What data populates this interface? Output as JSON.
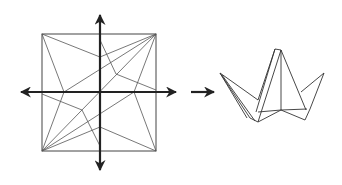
{
  "diagram": {
    "type": "origami-instruction",
    "steps": [
      {
        "name": "crease-pattern",
        "description": "Square crease pattern with perpendicular fold-direction arrows"
      },
      {
        "name": "transition-arrow",
        "description": "Right-pointing arrow to result"
      },
      {
        "name": "folded-model",
        "description": "Folded crane-like base with raised points"
      }
    ],
    "colors": {
      "line": "#444444",
      "arrow": "#222222",
      "background": "#ffffff"
    }
  }
}
